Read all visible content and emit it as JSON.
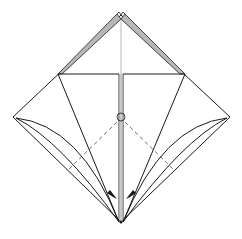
{
  "diagram": {
    "type": "origami-diagram",
    "colors": {
      "line": "#1a1a1a",
      "shade": "#b8b8b8",
      "dash": "#707070",
      "background": "#ffffff"
    },
    "elements": [
      {
        "name": "outer-square-outline",
        "desc": "square paper rotated 45 degrees"
      },
      {
        "name": "top-shaded-layers",
        "desc": "gray colored edges along top two sides"
      },
      {
        "name": "center-vertical-crease",
        "desc": "thin center line"
      },
      {
        "name": "horizontal-edge",
        "desc": "top edge of front flap"
      },
      {
        "name": "kite-flaps",
        "desc": "two side flap lines to bottom point"
      },
      {
        "name": "center-slit",
        "desc": "narrow vertical slit in middle"
      },
      {
        "name": "reference-circle",
        "desc": "small circle marking center point"
      },
      {
        "name": "valley-fold-lines",
        "desc": "dashed lines from center to sides"
      },
      {
        "name": "curved-edges",
        "desc": "curved flap edges on both sides"
      },
      {
        "name": "fold-arrows",
        "desc": "two arrows pointing toward bottom point"
      }
    ]
  }
}
